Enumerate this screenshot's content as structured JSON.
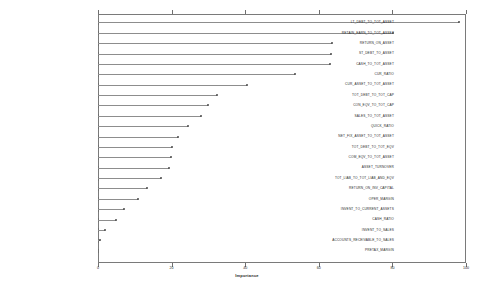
{
  "chart_data": {
    "type": "bar",
    "orientation": "horizontal",
    "title": "",
    "xlabel": "Importance",
    "ylabel": "",
    "xlim": [
      0,
      100
    ],
    "ylim": [
      0,
      23
    ],
    "grid": false,
    "legend": null,
    "xticks": [
      0,
      20,
      40,
      60,
      80,
      100
    ],
    "categories": [
      "LT_DEBT_TO_TOT_ASSET",
      "RETAIN_EARN_TO_TOT_ASSET",
      "RETURN_ON_ASSET",
      "ST_DEBT_TO_ASSET",
      "CASH_TO_TOT_ASSET",
      "CUR_RATIO",
      "CUR_ASSET_TO_TOT_ASSET",
      "TOT_DEBT_TO_TOT_CAP",
      "CON_EQV_TO_TOT_CAP",
      "SALES_TO_TOT_ASSET",
      "QUICK_RATIO",
      "NET_FIX_ASSET_TO_TOT_ASSET",
      "TOT_DEBT_TO_TOT_EQV",
      "COM_EQV_TO_TOT_ASSET",
      "ASSET_TURNOVER",
      "TOT_LIAB_TO_TOT_LIAB_AND_EQV",
      "RETURN_ON_INV_CAPITAL",
      "OPER_MARGIN",
      "INVENT_TO_CURRENT_ASSETS",
      "CASH_RATIO",
      "INVENT_TO_SALES",
      "ACCOUNTS_RECEIVABLE_TO_SALES",
      "PRETAX_MARGIN"
    ],
    "values": [
      98.0,
      80.2,
      63.6,
      63.2,
      63.0,
      53.5,
      40.5,
      32.4,
      29.8,
      28.0,
      24.5,
      21.8,
      20.0,
      19.8,
      19.4,
      17.2,
      13.4,
      11.0,
      7.2,
      5.0,
      2.0,
      0.6,
      0.0
    ],
    "series_name": "Feature importance",
    "marker": "circle",
    "line_color": "#8d8d8d",
    "marker_color": "#4a4a4a",
    "axis_color": "#7a7a7a",
    "background_color": "#ffffff",
    "text_color": "#2b2b2b"
  }
}
